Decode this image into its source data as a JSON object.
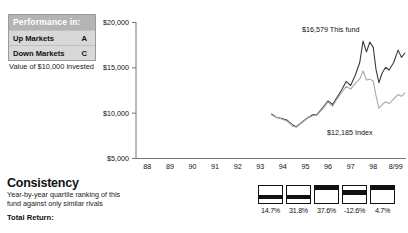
{
  "performance_box": {
    "header": "Performance in:",
    "rows": [
      {
        "label": "Up Markets",
        "grade": "A"
      },
      {
        "label": "Down Markets",
        "grade": "C"
      }
    ],
    "caption": "Value of $10,000 invested"
  },
  "consistency": {
    "title": "Consistency",
    "description": "Year-by-year quartile ranking of this fund against only similar rivals",
    "total_return_label": "Total Return:",
    "cells": [
      {
        "value": "14.7%",
        "quartile": 3
      },
      {
        "value": "31.8%",
        "quartile": 3
      },
      {
        "value": "37.6%",
        "quartile": 1
      },
      {
        "value": "-12.6%",
        "quartile": 2
      },
      {
        "value": "4.7%",
        "quartile": 1
      }
    ]
  },
  "chart_data": {
    "type": "line",
    "title": "",
    "xlabel": "",
    "ylabel": "",
    "ylim": [
      5000,
      20000
    ],
    "yticks": [
      5000,
      10000,
      15000,
      20000
    ],
    "ytick_labels": [
      "$5,000",
      "$10,000",
      "$15,000",
      "$20,000"
    ],
    "grid": false,
    "legend_position": "inline-annotation",
    "x": [
      "88",
      "89",
      "90",
      "91",
      "92",
      "93",
      "94",
      "95",
      "96",
      "97",
      "98",
      "8/99"
    ],
    "xtick_labels": [
      "88",
      "89",
      "90",
      "91",
      "92",
      "93",
      "94",
      "95",
      "96",
      "97",
      "98",
      "8/99"
    ],
    "series": [
      {
        "name": "This fund",
        "color": "#3a3a3a",
        "annotation": "$16,579 This fund",
        "final_value": 16579,
        "points": [
          [
            1994.0,
            9850
          ],
          [
            1994.2,
            9500
          ],
          [
            1994.45,
            9350
          ],
          [
            1994.7,
            9150
          ],
          [
            1994.95,
            8600
          ],
          [
            1995.1,
            8450
          ],
          [
            1995.35,
            8950
          ],
          [
            1995.6,
            9450
          ],
          [
            1995.85,
            9800
          ],
          [
            1996.0,
            9750
          ],
          [
            1996.25,
            10500
          ],
          [
            1996.5,
            11300
          ],
          [
            1996.7,
            10900
          ],
          [
            1996.9,
            11700
          ],
          [
            1997.1,
            12500
          ],
          [
            1997.3,
            13450
          ],
          [
            1997.5,
            13000
          ],
          [
            1997.7,
            14100
          ],
          [
            1997.9,
            15500
          ],
          [
            1998.05,
            17900
          ],
          [
            1998.2,
            16700
          ],
          [
            1998.35,
            17800
          ],
          [
            1998.5,
            17200
          ],
          [
            1998.62,
            14800
          ],
          [
            1998.75,
            13300
          ],
          [
            1998.9,
            14400
          ],
          [
            1999.05,
            15000
          ],
          [
            1999.2,
            14700
          ],
          [
            1999.4,
            15500
          ],
          [
            1999.6,
            16900
          ],
          [
            1999.75,
            16100
          ],
          [
            1999.9,
            16579
          ]
        ]
      },
      {
        "name": "Index",
        "color": "#a8a8a8",
        "annotation": "$12,185 Index",
        "final_value": 12185,
        "points": [
          [
            1994.0,
            9780
          ],
          [
            1994.2,
            9480
          ],
          [
            1994.45,
            9300
          ],
          [
            1994.7,
            9050
          ],
          [
            1994.95,
            8500
          ],
          [
            1995.1,
            8400
          ],
          [
            1995.35,
            8900
          ],
          [
            1995.6,
            9400
          ],
          [
            1995.85,
            9700
          ],
          [
            1996.0,
            9700
          ],
          [
            1996.25,
            10400
          ],
          [
            1996.5,
            11200
          ],
          [
            1996.7,
            10700
          ],
          [
            1996.9,
            11500
          ],
          [
            1997.1,
            12200
          ],
          [
            1997.3,
            12900
          ],
          [
            1997.5,
            12600
          ],
          [
            1997.7,
            13200
          ],
          [
            1997.9,
            13700
          ],
          [
            1998.05,
            14600
          ],
          [
            1998.2,
            13600
          ],
          [
            1998.35,
            13700
          ],
          [
            1998.5,
            13500
          ],
          [
            1998.62,
            11900
          ],
          [
            1998.75,
            10500
          ],
          [
            1998.9,
            10900
          ],
          [
            1999.05,
            11200
          ],
          [
            1999.2,
            11000
          ],
          [
            1999.4,
            11500
          ],
          [
            1999.6,
            12000
          ],
          [
            1999.75,
            11800
          ],
          [
            1999.9,
            12185
          ]
        ]
      }
    ]
  }
}
